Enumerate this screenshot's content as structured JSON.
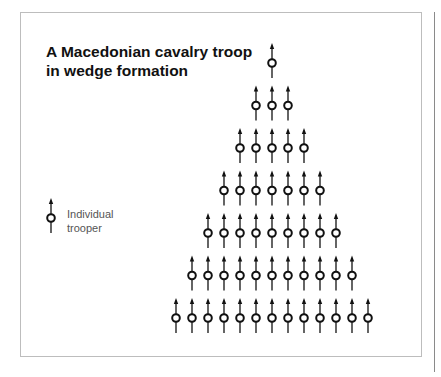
{
  "title": {
    "line1": "A Macedonian cavalry troop",
    "line2": "in wedge formation"
  },
  "legend": {
    "icon": "trooper-icon",
    "line1": "Individual",
    "line2": "trooper"
  },
  "formation": {
    "rows": [
      1,
      3,
      5,
      7,
      9,
      11,
      13
    ],
    "total_troopers": 49,
    "direction": "up"
  },
  "colors": {
    "stroke": "#111111",
    "frame": "#bdbdbd"
  }
}
